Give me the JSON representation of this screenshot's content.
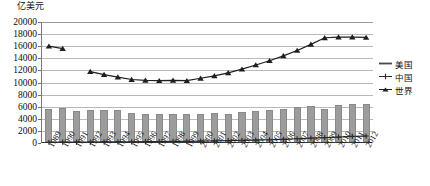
{
  "axis_caption": "亿美元",
  "legend": {
    "items": [
      {
        "label": "美国",
        "marker": "line",
        "color": "#4a4a4a",
        "name": "legend-item-usa"
      },
      {
        "label": "中国",
        "marker": "cross",
        "color": "#2b2b2b",
        "name": "legend-item-china"
      },
      {
        "label": "世界",
        "marker": "triangle",
        "color": "#1f1f1f",
        "name": "legend-item-world"
      }
    ]
  },
  "chart_data": {
    "type": "bar",
    "title": "",
    "subtitle": "",
    "xlabel": "",
    "ylabel": "亿美元",
    "ylim": [
      0,
      20000
    ],
    "ytick_step": 2000,
    "yticks": [
      20000,
      18000,
      16000,
      14000,
      12000,
      10000,
      8000,
      6000,
      4000,
      2000,
      0
    ],
    "grid": true,
    "legend_position": "right",
    "categories": [
      "1989",
      "1990",
      "1991",
      "1992",
      "1993",
      "1994",
      "1995",
      "1996",
      "1997",
      "1998",
      "1999",
      "2000",
      "2001",
      "2002",
      "2003",
      "2004",
      "2005",
      "2006",
      "2007",
      "2008",
      "2009",
      "2010",
      "2011",
      "2012"
    ],
    "series": [
      {
        "name": "美国",
        "type": "bar",
        "color": "#9c9c9c",
        "values": [
          5400,
          5600,
          5150,
          5300,
          5350,
          5250,
          4750,
          4700,
          4650,
          4600,
          4600,
          4550,
          4800,
          4600,
          4900,
          5150,
          5350,
          5400,
          5750,
          5950,
          5450,
          6200,
          6250,
          6300
        ]
      },
      {
        "name": "中国",
        "type": "line",
        "color": "#2b2b2b",
        "values": [
          120,
          130,
          140,
          160,
          180,
          190,
          200,
          220,
          240,
          260,
          280,
          320,
          340,
          380,
          420,
          480,
          540,
          610,
          700,
          790,
          880,
          980,
          1080,
          1150
        ]
      },
      {
        "name": "世界",
        "type": "line",
        "color": "#1f1f1f",
        "values": [
          16000,
          15600,
          null,
          11800,
          11300,
          10900,
          10500,
          10350,
          10300,
          10350,
          10300,
          10700,
          11100,
          11600,
          12200,
          12900,
          13600,
          14400,
          15300,
          16300,
          17400,
          17500,
          17500,
          17450
        ]
      }
    ]
  }
}
